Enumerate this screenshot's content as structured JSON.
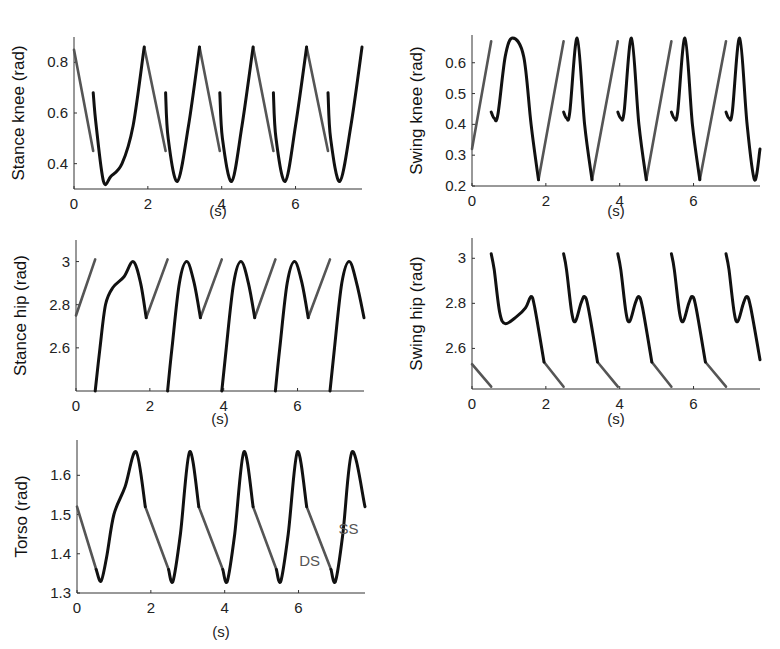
{
  "colors": {
    "single_support": "#111111",
    "double_support": "#555555",
    "axis": "#333333"
  },
  "annotations": {
    "ds": "DS",
    "ss": "SS"
  },
  "chart_data": [
    {
      "type": "line",
      "title": "",
      "ylabel": "Stance knee (rad)",
      "xlabel": "(s)",
      "xlim": [
        0,
        7.8
      ],
      "ylim": [
        0.3,
        0.9
      ],
      "xticks": [
        "0",
        "2",
        "4",
        "6"
      ],
      "yticks": [
        "0.4",
        "0.6",
        "0.8"
      ],
      "grid": false,
      "series": [
        {
          "name": "SS",
          "color": "#111111",
          "description": "single support, black; starts 0.68 at each step, dips to ~0.33, rises to ~0.86",
          "segments": [
            {
              "x": [
                0.52,
                0.6,
                0.8,
                1.0,
                1.3,
                1.6,
                1.9
              ],
              "y": [
                0.68,
                0.55,
                0.33,
                0.35,
                0.4,
                0.55,
                0.86
              ]
            },
            {
              "x": [
                2.48,
                2.55,
                2.8,
                3.1,
                3.4
              ],
              "y": [
                0.68,
                0.5,
                0.33,
                0.55,
                0.86
              ]
            },
            {
              "x": [
                3.95,
                4.02,
                4.27,
                4.55,
                4.85
              ],
              "y": [
                0.68,
                0.5,
                0.33,
                0.55,
                0.86
              ]
            },
            {
              "x": [
                5.4,
                5.47,
                5.72,
                6.0,
                6.3
              ],
              "y": [
                0.68,
                0.5,
                0.33,
                0.55,
                0.86
              ]
            },
            {
              "x": [
                6.88,
                6.95,
                7.2,
                7.5,
                7.8
              ],
              "y": [
                0.68,
                0.5,
                0.33,
                0.55,
                0.86
              ]
            }
          ]
        },
        {
          "name": "DS",
          "color": "#555555",
          "description": "double support, gray; linear decrease 0.86 to 0.45",
          "segments": [
            {
              "x": [
                0,
                0.52
              ],
              "y": [
                0.85,
                0.45
              ]
            },
            {
              "x": [
                1.9,
                2.48
              ],
              "y": [
                0.86,
                0.45
              ]
            },
            {
              "x": [
                3.4,
                3.95
              ],
              "y": [
                0.86,
                0.45
              ]
            },
            {
              "x": [
                4.85,
                5.4
              ],
              "y": [
                0.86,
                0.45
              ]
            },
            {
              "x": [
                6.3,
                6.88
              ],
              "y": [
                0.86,
                0.45
              ]
            }
          ]
        }
      ]
    },
    {
      "type": "line",
      "title": "",
      "ylabel": "Swing knee (rad)",
      "xlabel": "(s)",
      "xlim": [
        0,
        7.8
      ],
      "ylim": [
        0.2,
        0.69
      ],
      "xticks": [
        "0",
        "2",
        "4",
        "6"
      ],
      "yticks": [
        "0.2",
        "0.3",
        "0.4",
        "0.5",
        "0.6"
      ],
      "grid": false,
      "series": [
        {
          "name": "SS",
          "color": "#111111",
          "segments": [
            {
              "x": [
                0.52,
                0.6,
                0.7,
                0.9,
                1.1,
                1.4,
                1.6,
                1.8
              ],
              "y": [
                0.44,
                0.42,
                0.43,
                0.62,
                0.68,
                0.62,
                0.4,
                0.22
              ]
            },
            {
              "x": [
                2.48,
                2.56,
                2.65,
                2.85,
                3.05,
                3.25
              ],
              "y": [
                0.44,
                0.42,
                0.44,
                0.68,
                0.4,
                0.22
              ]
            },
            {
              "x": [
                3.95,
                4.03,
                4.12,
                4.32,
                4.52,
                4.72
              ],
              "y": [
                0.44,
                0.42,
                0.44,
                0.68,
                0.4,
                0.22
              ]
            },
            {
              "x": [
                5.4,
                5.48,
                5.57,
                5.77,
                5.97,
                6.17
              ],
              "y": [
                0.44,
                0.42,
                0.44,
                0.68,
                0.4,
                0.22
              ]
            },
            {
              "x": [
                6.88,
                6.96,
                7.05,
                7.25,
                7.45,
                7.65,
                7.8
              ],
              "y": [
                0.44,
                0.42,
                0.44,
                0.68,
                0.4,
                0.22,
                0.32
              ]
            }
          ]
        },
        {
          "name": "DS",
          "color": "#555555",
          "segments": [
            {
              "x": [
                0,
                0.52
              ],
              "y": [
                0.32,
                0.67
              ]
            },
            {
              "x": [
                1.8,
                2.48
              ],
              "y": [
                0.22,
                0.67
              ]
            },
            {
              "x": [
                3.25,
                3.95
              ],
              "y": [
                0.22,
                0.67
              ]
            },
            {
              "x": [
                4.72,
                5.4
              ],
              "y": [
                0.22,
                0.67
              ]
            },
            {
              "x": [
                6.17,
                6.88
              ],
              "y": [
                0.22,
                0.67
              ]
            }
          ]
        }
      ]
    },
    {
      "type": "line",
      "title": "",
      "ylabel": "Stance hip (rad)",
      "xlabel": "(s)",
      "xlim": [
        0,
        7.8
      ],
      "ylim": [
        2.4,
        3.1
      ],
      "xticks": [
        "0",
        "2",
        "4",
        "6"
      ],
      "yticks": [
        "2.6",
        "2.8",
        "3"
      ],
      "grid": false,
      "series": [
        {
          "name": "SS",
          "color": "#111111",
          "segments": [
            {
              "x": [
                0.52,
                0.65,
                0.8,
                1.0,
                1.3,
                1.55,
                1.75,
                1.9
              ],
              "y": [
                2.4,
                2.6,
                2.8,
                2.88,
                2.93,
                3.0,
                2.9,
                2.74
              ]
            },
            {
              "x": [
                2.48,
                2.6,
                2.8,
                3.0,
                3.2,
                3.37
              ],
              "y": [
                2.4,
                2.6,
                2.9,
                3.0,
                2.9,
                2.74
              ]
            },
            {
              "x": [
                3.95,
                4.07,
                4.27,
                4.47,
                4.67,
                4.84
              ],
              "y": [
                2.4,
                2.6,
                2.9,
                3.0,
                2.9,
                2.74
              ]
            },
            {
              "x": [
                5.4,
                5.52,
                5.72,
                5.92,
                6.12,
                6.29
              ],
              "y": [
                2.4,
                2.6,
                2.9,
                3.0,
                2.9,
                2.74
              ]
            },
            {
              "x": [
                6.88,
                7.0,
                7.2,
                7.4,
                7.6,
                7.8
              ],
              "y": [
                2.4,
                2.6,
                2.9,
                3.0,
                2.9,
                2.74
              ]
            }
          ]
        },
        {
          "name": "DS",
          "color": "#555555",
          "segments": [
            {
              "x": [
                0,
                0.52
              ],
              "y": [
                2.75,
                3.01
              ]
            },
            {
              "x": [
                1.9,
                2.48
              ],
              "y": [
                2.74,
                3.01
              ]
            },
            {
              "x": [
                3.37,
                3.95
              ],
              "y": [
                2.74,
                3.01
              ]
            },
            {
              "x": [
                4.84,
                5.4
              ],
              "y": [
                2.74,
                3.01
              ]
            },
            {
              "x": [
                6.29,
                6.88
              ],
              "y": [
                2.74,
                3.01
              ]
            }
          ]
        }
      ]
    },
    {
      "type": "line",
      "title": "",
      "ylabel": "Swing hip (rad)",
      "xlabel": "(s)",
      "xlim": [
        0,
        7.8
      ],
      "ylim": [
        2.42,
        3.09
      ],
      "xticks": [
        "0",
        "2",
        "4",
        "6"
      ],
      "yticks": [
        "2.6",
        "2.8",
        "3"
      ],
      "grid": false,
      "series": [
        {
          "name": "SS",
          "color": "#111111",
          "segments": [
            {
              "x": [
                0.52,
                0.6,
                0.75,
                0.9,
                1.2,
                1.45,
                1.6,
                1.7,
                1.95
              ],
              "y": [
                3.02,
                2.95,
                2.76,
                2.71,
                2.74,
                2.78,
                2.83,
                2.78,
                2.54
              ]
            },
            {
              "x": [
                2.48,
                2.56,
                2.7,
                2.8,
                2.95,
                3.05,
                3.15,
                3.4
              ],
              "y": [
                3.02,
                2.95,
                2.76,
                2.72,
                2.8,
                2.83,
                2.78,
                2.54
              ]
            },
            {
              "x": [
                3.95,
                4.03,
                4.17,
                4.27,
                4.42,
                4.52,
                4.62,
                4.87
              ],
              "y": [
                3.02,
                2.95,
                2.76,
                2.72,
                2.8,
                2.83,
                2.78,
                2.54
              ]
            },
            {
              "x": [
                5.4,
                5.48,
                5.62,
                5.72,
                5.87,
                5.97,
                6.07,
                6.32
              ],
              "y": [
                3.02,
                2.95,
                2.76,
                2.72,
                2.8,
                2.83,
                2.78,
                2.54
              ]
            },
            {
              "x": [
                6.88,
                6.96,
                7.1,
                7.2,
                7.35,
                7.45,
                7.55,
                7.8
              ],
              "y": [
                3.02,
                2.95,
                2.76,
                2.72,
                2.8,
                2.83,
                2.78,
                2.55
              ]
            }
          ]
        },
        {
          "name": "DS",
          "color": "#555555",
          "segments": [
            {
              "x": [
                0,
                0.52
              ],
              "y": [
                2.53,
                2.43
              ]
            },
            {
              "x": [
                1.95,
                2.48
              ],
              "y": [
                2.54,
                2.43
              ]
            },
            {
              "x": [
                3.4,
                3.95
              ],
              "y": [
                2.54,
                2.43
              ]
            },
            {
              "x": [
                4.87,
                5.4
              ],
              "y": [
                2.54,
                2.43
              ]
            },
            {
              "x": [
                6.32,
                6.88
              ],
              "y": [
                2.54,
                2.43
              ]
            }
          ]
        }
      ]
    },
    {
      "type": "line",
      "title": "",
      "ylabel": "Torso (rad)",
      "xlabel": "(s)",
      "xlim": [
        0,
        7.8
      ],
      "ylim": [
        1.3,
        1.69
      ],
      "xticks": [
        "0",
        "2",
        "4",
        "6"
      ],
      "yticks": [
        "1.3",
        "1.4",
        "1.5",
        "1.6"
      ],
      "grid": false,
      "annotations": [
        {
          "text": "DS",
          "x": 6.3,
          "y": 1.37
        },
        {
          "text": "SS",
          "x": 7.35,
          "y": 1.45
        }
      ],
      "series": [
        {
          "name": "SS",
          "color": "#111111",
          "segments": [
            {
              "x": [
                0.52,
                0.65,
                0.8,
                1.0,
                1.3,
                1.6,
                1.85
              ],
              "y": [
                1.36,
                1.33,
                1.39,
                1.5,
                1.57,
                1.66,
                1.52
              ]
            },
            {
              "x": [
                2.48,
                2.6,
                2.8,
                3.05,
                3.3
              ],
              "y": [
                1.36,
                1.33,
                1.45,
                1.66,
                1.52
              ]
            },
            {
              "x": [
                3.95,
                4.07,
                4.27,
                4.52,
                4.77
              ],
              "y": [
                1.36,
                1.33,
                1.45,
                1.66,
                1.52
              ]
            },
            {
              "x": [
                5.4,
                5.52,
                5.72,
                5.97,
                6.22
              ],
              "y": [
                1.36,
                1.33,
                1.45,
                1.66,
                1.52
              ]
            },
            {
              "x": [
                6.88,
                7.0,
                7.2,
                7.45,
                7.8
              ],
              "y": [
                1.36,
                1.33,
                1.45,
                1.66,
                1.52
              ]
            }
          ]
        },
        {
          "name": "DS",
          "color": "#555555",
          "segments": [
            {
              "x": [
                0,
                0.52
              ],
              "y": [
                1.52,
                1.36
              ]
            },
            {
              "x": [
                1.85,
                2.48
              ],
              "y": [
                1.52,
                1.36
              ]
            },
            {
              "x": [
                3.3,
                3.95
              ],
              "y": [
                1.52,
                1.36
              ]
            },
            {
              "x": [
                4.77,
                5.4
              ],
              "y": [
                1.52,
                1.36
              ]
            },
            {
              "x": [
                6.22,
                6.88
              ],
              "y": [
                1.52,
                1.36
              ]
            }
          ]
        }
      ]
    }
  ]
}
